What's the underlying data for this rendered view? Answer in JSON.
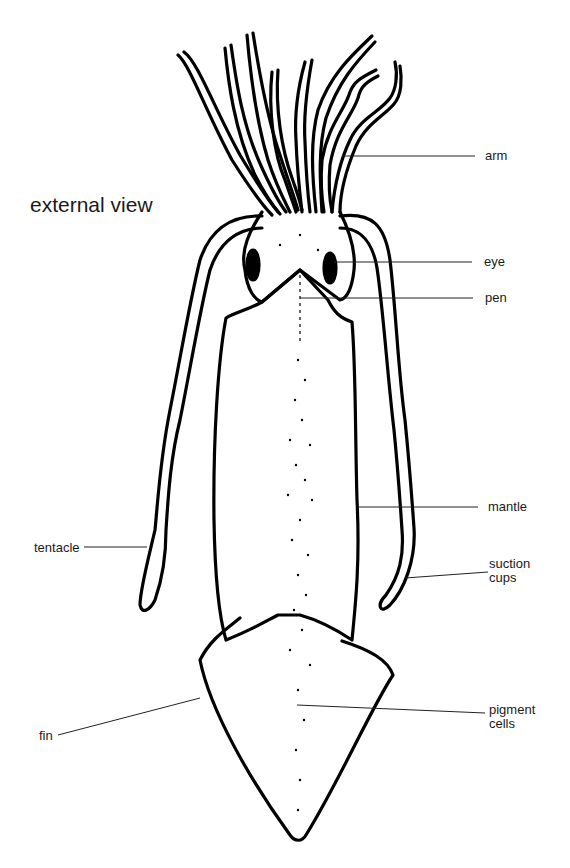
{
  "diagram": {
    "subtitle": "external view",
    "outline_color": "#000000",
    "background_color": "#ffffff",
    "labels": {
      "arm": "arm",
      "eye": "eye",
      "pen": "pen",
      "mantle": "mantle",
      "tentacle": "tentacle",
      "suction_cups": "suction\ncups",
      "fin": "fin",
      "pigment_cells": "pigment\ncells"
    }
  }
}
